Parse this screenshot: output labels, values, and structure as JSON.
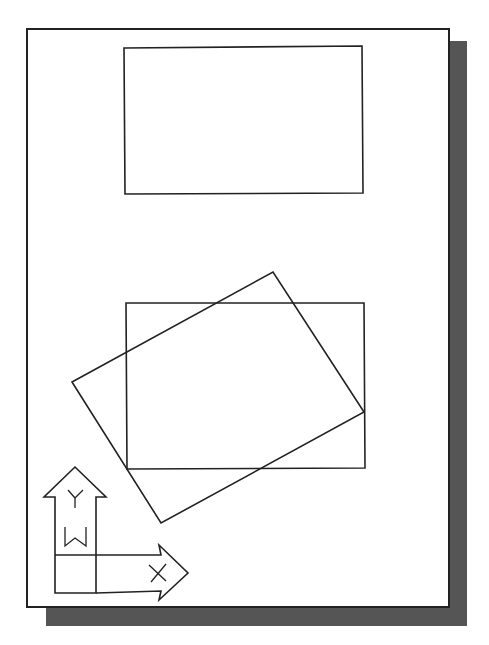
{
  "diagram": {
    "colors": {
      "line": "#222222",
      "paper": "#ffffff",
      "shadow": "#555555"
    },
    "sheet": {
      "x": 26,
      "y": 28,
      "width": 424,
      "height": 580
    },
    "shadow": {
      "x": 46,
      "y": 41,
      "width": 421,
      "height": 585
    },
    "shapes": {
      "top_rectangle": {
        "points": "124,48 362,46 363,193 125,194"
      },
      "lower_rectangle": {
        "points": "126,303 364,303 365,468 127,469"
      },
      "rotated_rectangle": {
        "points": "72,382 273,272 364,412 161,523"
      }
    },
    "ucs_icon": {
      "axis_y_label": "Y",
      "axis_x_label": "X",
      "world_label": "W"
    }
  }
}
